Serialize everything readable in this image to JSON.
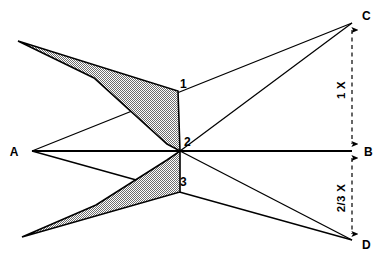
{
  "diagram": {
    "background_color": "#ffffff",
    "line_color": "#000000",
    "shade_fill_color": "#b8b8b8",
    "labels": {
      "a": "A",
      "b": "B",
      "c": "C",
      "d": "D",
      "point1": "1",
      "point2": "2",
      "point3": "3"
    },
    "dimensions": {
      "upper": "1 X",
      "lower": "2/3 X"
    },
    "points": {
      "A": {
        "x": 32,
        "y": 151
      },
      "B": {
        "x": 352,
        "y": 151
      },
      "C": {
        "x": 352,
        "y": 23
      },
      "D": {
        "x": 352,
        "y": 240
      },
      "p1": {
        "x": 178,
        "y": 91
      },
      "p2": {
        "x": 180,
        "y": 151
      },
      "p3": {
        "x": 180,
        "y": 192
      },
      "upper_tip": {
        "x": 18,
        "y": 41
      },
      "upper_notch": {
        "x": 93,
        "y": 78
      },
      "lower_tip": {
        "x": 22,
        "y": 237
      },
      "lower_notch": {
        "x": 95,
        "y": 205
      }
    },
    "rays": [
      {
        "name": "ray-a-to-c",
        "from": "A",
        "through": "p1",
        "to": "C"
      },
      {
        "name": "ray-a-to-b",
        "from": "A",
        "to": "B"
      },
      {
        "name": "ray-a-to-d",
        "from": "A",
        "through": "p3",
        "to": "D"
      },
      {
        "name": "ray-p2-to-c",
        "from": "p2",
        "to": "C"
      },
      {
        "name": "ray-p2-to-d",
        "from": "p2",
        "to": "D"
      }
    ],
    "shaded_bands": [
      {
        "name": "upper-band",
        "outline": "18,41 178,91 180,151 168,145 93,78"
      },
      {
        "name": "lower-band",
        "outline": "22,237 180,192 180,151 168,160 95,205"
      }
    ]
  }
}
